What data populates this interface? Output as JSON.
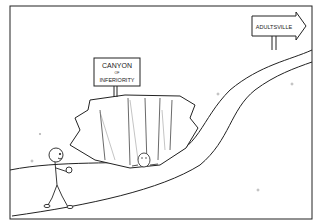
{
  "illustration": {
    "type": "cartoon",
    "signs": {
      "canyon": {
        "line1": "CANYON",
        "line2": "OF",
        "line3": "INFERIORITY"
      },
      "destination": {
        "label": "ADULTSVILLE",
        "direction": "right"
      }
    },
    "figures": [
      "walking-child",
      "person-in-canyon"
    ],
    "colors": {
      "ink": "#222222",
      "paper": "#ffffff"
    }
  }
}
